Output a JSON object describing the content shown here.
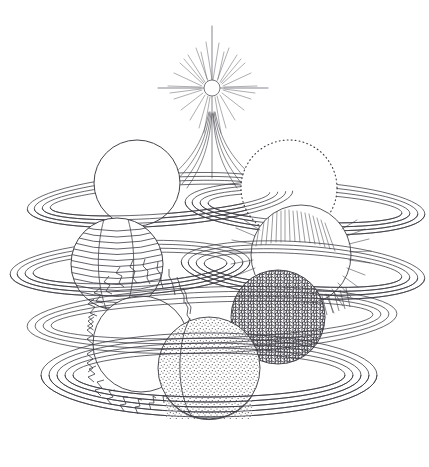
{
  "artwork": {
    "title": "Orbiting Planets and Star",
    "medium": "pen-and-ink line drawing",
    "background_color": "#ffffff",
    "ink_color": "#3a3a42",
    "canvas": {
      "width": 429,
      "height": 467
    }
  },
  "star": {
    "label": "central star",
    "center": {
      "x": 212,
      "y": 88
    },
    "core_radius": 8,
    "long_ray_length": 62,
    "short_ray_count": 28,
    "tail_count": 8
  },
  "planets": [
    {
      "id": "planet-plain-top-left",
      "label": "Plain sphere",
      "texture": "plain",
      "outline": "solid",
      "cx": 137,
      "cy": 183,
      "r": 43
    },
    {
      "id": "planet-dotted-top-right",
      "label": "Dotted outline sphere",
      "texture": "plain",
      "outline": "dotted",
      "cx": 289,
      "cy": 188,
      "r": 48
    },
    {
      "id": "planet-banded-left",
      "label": "Banded striped sphere",
      "texture": "bands",
      "outline": "solid",
      "cx": 117,
      "cy": 264,
      "r": 46
    },
    {
      "id": "planet-furry-right",
      "label": "Hairy fringed sphere",
      "texture": "fur",
      "outline": "solid",
      "cx": 301,
      "cy": 255,
      "r": 50
    },
    {
      "id": "planet-scribble-right",
      "label": "Dense scribbled sphere",
      "texture": "scribble",
      "outline": "solid",
      "cx": 278,
      "cy": 317,
      "r": 47
    },
    {
      "id": "planet-spiky-bottom-left",
      "label": "Spiky jagged-edge sphere",
      "texture": "plain",
      "outline": "spiky",
      "cx": 141,
      "cy": 344,
      "r": 48
    },
    {
      "id": "planet-stipple-bottom",
      "label": "Stippled sand sphere",
      "texture": "stipple",
      "outline": "solid",
      "cx": 209,
      "cy": 368,
      "r": 51
    }
  ],
  "rings": [
    {
      "id": "ring-upper-left",
      "label": "Upper left ring system",
      "cx": 160,
      "cy": 200,
      "rx": 133,
      "ry": 26,
      "rotate": -4,
      "bands": 4
    },
    {
      "id": "ring-upper-right",
      "label": "Upper right ring system",
      "cx": 305,
      "cy": 208,
      "rx": 120,
      "ry": 26,
      "rotate": 3,
      "bands": 4
    },
    {
      "id": "ring-mid-left",
      "label": "Middle left ring system",
      "cx": 130,
      "cy": 268,
      "rx": 120,
      "ry": 27,
      "rotate": -3,
      "bands": 4
    },
    {
      "id": "ring-mid-right",
      "label": "Middle right ring system",
      "cx": 303,
      "cy": 270,
      "rx": 122,
      "ry": 28,
      "rotate": 4,
      "bands": 4
    },
    {
      "id": "ring-lower-upper",
      "label": "Lower upper ring system",
      "cx": 212,
      "cy": 320,
      "rx": 185,
      "ry": 33,
      "rotate": -2,
      "bands": 4
    },
    {
      "id": "ring-bottom",
      "label": "Bottom wide ring system",
      "cx": 209,
      "cy": 375,
      "rx": 168,
      "ry": 42,
      "rotate": 0,
      "bands": 5
    }
  ]
}
